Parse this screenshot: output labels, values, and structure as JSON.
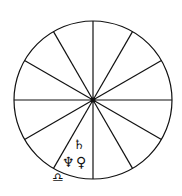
{
  "diagram": {
    "type": "astrological-chart-wheel",
    "houses": 12,
    "center": [
      93,
      100
    ],
    "radius": 79,
    "line_color": "#111111",
    "background": "#ffffff"
  },
  "symbols": [
    {
      "name": "saturn",
      "glyph": "♄",
      "x": 73,
      "y": 149
    },
    {
      "name": "neptune",
      "glyph": "♆",
      "x": 68,
      "y": 167
    },
    {
      "name": "venus",
      "glyph": "♀",
      "x": 83,
      "y": 167
    },
    {
      "name": "libra",
      "glyph": "♎",
      "x": 57,
      "y": 181
    }
  ]
}
